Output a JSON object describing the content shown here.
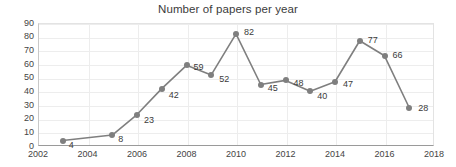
{
  "chart_data": {
    "type": "line",
    "title": "Number of papers per year",
    "xlabel": "",
    "ylabel": "",
    "x": [
      2003,
      2005,
      2006,
      2007,
      2008,
      2009,
      2010,
      2011,
      2012,
      2013,
      2014,
      2015,
      2016,
      2017
    ],
    "values": [
      4,
      8,
      23,
      42,
      59,
      52,
      82,
      45,
      48,
      40,
      47,
      77,
      66,
      28
    ],
    "data_labels": [
      "4",
      "8",
      "23",
      "42",
      "59",
      "52",
      "82",
      "45",
      "48",
      "40",
      "47",
      "77",
      "66",
      "28"
    ],
    "xlim": [
      2002,
      2018
    ],
    "ylim": [
      0,
      90
    ],
    "xticks": [
      "2002",
      "2004",
      "2006",
      "2008",
      "2010",
      "2012",
      "2014",
      "2016",
      "2018"
    ],
    "xtick_values": [
      2002,
      2004,
      2006,
      2008,
      2010,
      2012,
      2014,
      2016,
      2018
    ],
    "yticks": [
      "0",
      "10",
      "20",
      "30",
      "40",
      "50",
      "60",
      "70",
      "80",
      "90"
    ],
    "ytick_values": [
      0,
      10,
      20,
      30,
      40,
      50,
      60,
      70,
      80,
      90
    ],
    "grid": true,
    "legend": false,
    "series_color": "#7f7f7f",
    "marker": "circle",
    "label_offsets": [
      {
        "dx": 6,
        "dy": 4
      },
      {
        "dx": 6,
        "dy": 4
      },
      {
        "dx": 7,
        "dy": 5
      },
      {
        "dx": 7,
        "dy": 6
      },
      {
        "dx": 7,
        "dy": 2
      },
      {
        "dx": 8,
        "dy": 4
      },
      {
        "dx": 8,
        "dy": -2
      },
      {
        "dx": 7,
        "dy": 3
      },
      {
        "dx": 8,
        "dy": 3
      },
      {
        "dx": 7,
        "dy": 5
      },
      {
        "dx": 8,
        "dy": 2
      },
      {
        "dx": 8,
        "dy": -1
      },
      {
        "dx": 8,
        "dy": -1
      },
      {
        "dx": 9,
        "dy": 0
      }
    ]
  },
  "colors": {
    "series": "#7f7f7f",
    "grid": "#ededed",
    "axis": "#9a9a9a",
    "text": "#3b3b3b",
    "background": "#ffffff"
  }
}
